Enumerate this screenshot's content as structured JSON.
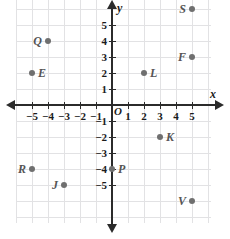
{
  "chart_data": {
    "type": "scatter",
    "title": "",
    "xlabel": "x",
    "ylabel": "y",
    "origin_label": "O",
    "grid": true,
    "xlim": [
      -6,
      6
    ],
    "ylim": [
      -7,
      7
    ],
    "x_ticks": [
      -5,
      -4,
      -3,
      -2,
      -1,
      1,
      2,
      3,
      4,
      5
    ],
    "y_ticks": [
      5,
      4,
      3,
      2,
      1,
      -1,
      -2,
      -3,
      -4,
      -5
    ],
    "x_tick_labels": [
      "−5",
      "−4",
      "−3",
      "−2",
      "−1",
      "1",
      "2",
      "3",
      "4",
      "5"
    ],
    "y_tick_labels": [
      "5",
      "4",
      "3",
      "2",
      "1",
      "−1",
      "−2",
      "−3",
      "−4",
      "−5"
    ],
    "point_color": "#6f6f6f",
    "axis_color": "#2b2b2b",
    "grid_color": "#e2e2e4",
    "points": [
      {
        "label": "S",
        "x": 5,
        "y": 6,
        "label_side": "left"
      },
      {
        "label": "Q",
        "x": -4,
        "y": 4,
        "label_side": "left"
      },
      {
        "label": "F",
        "x": 5,
        "y": 3,
        "label_side": "left"
      },
      {
        "label": "E",
        "x": -5,
        "y": 2,
        "label_side": "right"
      },
      {
        "label": "L",
        "x": 2,
        "y": 2,
        "label_side": "right"
      },
      {
        "label": "K",
        "x": 3,
        "y": -2,
        "label_side": "right"
      },
      {
        "label": "R",
        "x": -5,
        "y": -4,
        "label_side": "left"
      },
      {
        "label": "P",
        "x": 0,
        "y": -4,
        "label_side": "right"
      },
      {
        "label": "J",
        "x": -3,
        "y": -5,
        "label_side": "left"
      },
      {
        "label": "V",
        "x": 5,
        "y": -6,
        "label_side": "left"
      }
    ]
  }
}
